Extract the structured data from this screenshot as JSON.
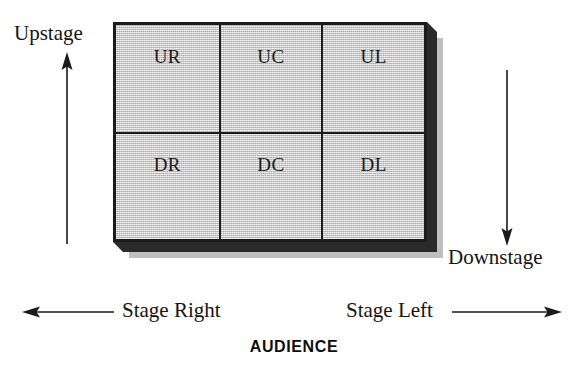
{
  "diagram": {
    "audience_label": "AUDIENCE",
    "colors": {
      "stage_fill": "#c9c9c9",
      "stage_border": "#1c1c1c",
      "extrusion": "#2a2a2a",
      "drop_shadow": "#bfbfbf",
      "text": "#141414",
      "background": "#ffffff"
    }
  },
  "stage": {
    "rows": [
      {
        "name": "upstage-row",
        "cells": [
          {
            "code": "UR",
            "meaning": "Upstage Right"
          },
          {
            "code": "UC",
            "meaning": "Upstage Center"
          },
          {
            "code": "UL",
            "meaning": "Upstage Left"
          }
        ]
      },
      {
        "name": "downstage-row",
        "cells": [
          {
            "code": "DR",
            "meaning": "Downstage Right"
          },
          {
            "code": "DC",
            "meaning": "Downstage Center"
          },
          {
            "code": "DL",
            "meaning": "Downstage Left"
          }
        ]
      }
    ]
  },
  "annotations": {
    "upstage": {
      "label": "Upstage",
      "arrow_direction": "up"
    },
    "downstage": {
      "label": "Downstage",
      "arrow_direction": "down"
    },
    "stage_right": {
      "label": "Stage Right",
      "arrow_direction": "left"
    },
    "stage_left": {
      "label": "Stage Left",
      "arrow_direction": "right"
    }
  }
}
